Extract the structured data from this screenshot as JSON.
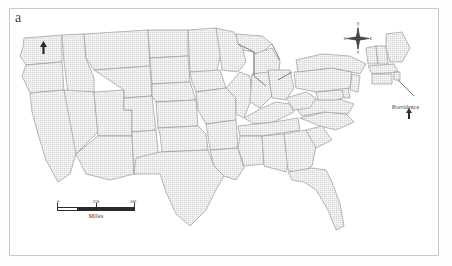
{
  "figure": {
    "panel_label": "a",
    "type": "map",
    "frame_color": "#c9c9c9",
    "background_color": "#ffffff"
  },
  "map": {
    "state_fill": "#e8e8e8",
    "state_border_color": "#9a9a9a",
    "coastline_color": "#6f6f6f",
    "fill_style": "stippled-light-gray"
  },
  "compass": {
    "name": "north-arrow",
    "north_label": "N",
    "south_label": "S",
    "east_label": "E",
    "west_label": "W"
  },
  "scalebar": {
    "caption": "Miles",
    "ticks": [
      "0",
      "250",
      "500"
    ],
    "segments": 4,
    "units": "Miles"
  },
  "annotations": {
    "cities": [
      {
        "name": "seattle-marker",
        "label": "",
        "marker": "arrow"
      },
      {
        "name": "providence-marker",
        "label": "Providence",
        "marker": "arrow"
      }
    ],
    "providence_label": "Providence"
  }
}
